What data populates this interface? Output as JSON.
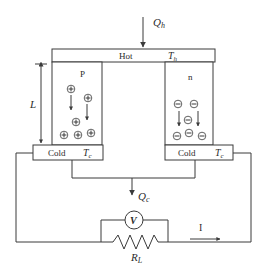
{
  "diagram": {
    "heat_in": {
      "symbol": "Q",
      "subscript": "h"
    },
    "heat_out": {
      "symbol": "Q",
      "subscript": "c"
    },
    "hot_plate": {
      "label": "Hot",
      "temp_symbol": "T",
      "temp_subscript": "h"
    },
    "cold_plates": [
      {
        "label": "Cold",
        "temp_symbol": "T",
        "temp_subscript": "c"
      },
      {
        "label": "Cold",
        "temp_symbol": "T",
        "temp_subscript": "c"
      }
    ],
    "legs": [
      {
        "type": "P",
        "carrier": "+",
        "carrier_count": 7
      },
      {
        "type": "n",
        "carrier": "−",
        "carrier_count": 7
      }
    ],
    "length_label": "L",
    "voltmeter_label": "V",
    "load": {
      "symbol": "R",
      "subscript": "L"
    },
    "current_label": "I"
  }
}
